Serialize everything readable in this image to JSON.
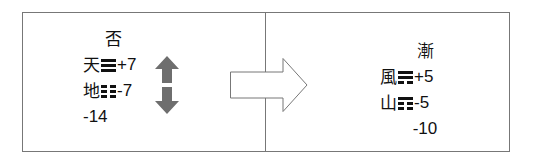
{
  "diagram": {
    "left": {
      "name": "否",
      "upper": {
        "char": "天",
        "trigram": [
          "solid",
          "solid",
          "solid"
        ],
        "value": "+7"
      },
      "lower": {
        "char": "地",
        "trigram": [
          "broken",
          "broken",
          "broken"
        ],
        "value": "-7"
      },
      "total": "-14",
      "arrow_icon": "up-down-arrow-icon",
      "arrow_color": "#6e6e6e"
    },
    "transition_icon": "right-arrow-icon",
    "right": {
      "name": "漸",
      "upper": {
        "char": "風",
        "trigram": [
          "solid",
          "solid",
          "broken"
        ],
        "value": "+5"
      },
      "lower": {
        "char": "山",
        "trigram": [
          "solid",
          "broken",
          "broken"
        ],
        "value": "-5"
      },
      "total": "-10"
    }
  }
}
